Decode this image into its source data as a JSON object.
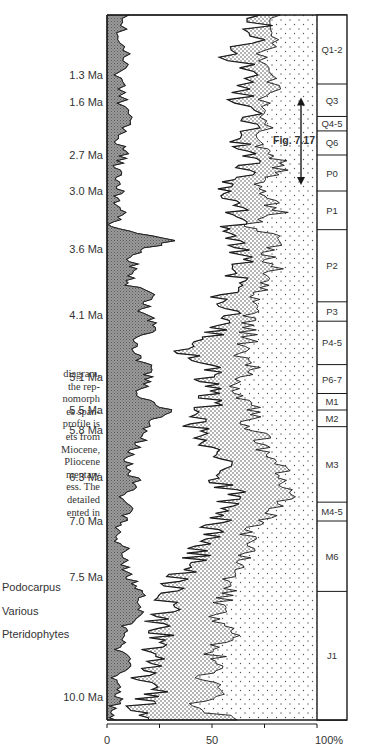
{
  "caption_fragment": [
    "diagram,",
    "the rep-",
    "nomorph",
    "es span-",
    "profile is",
    "ets from",
    "Miocene,",
    "Pliocene",
    "mentary",
    "ess. The",
    "detailed",
    "ented in"
  ],
  "legend": [
    {
      "label": "Podocarpus",
      "fill": "gray-crosshatch"
    },
    {
      "label": "Various",
      "fill": "white"
    },
    {
      "label": "Pteridophytes",
      "fill": "dense-dots"
    }
  ],
  "colors": {
    "podocarpus": "#8c8c8c",
    "line": "#1a1a1a",
    "dots": "#333333",
    "background": "#ffffff"
  },
  "chart_data": {
    "type": "area",
    "title": "",
    "xlabel": "",
    "ylabel": "Age",
    "xlim": [
      0,
      100
    ],
    "x_ticks": [
      0,
      25,
      50,
      75,
      100
    ],
    "x_tick_labels": [
      "0",
      "",
      "50",
      "",
      "100%"
    ],
    "y_direction": "age increases downward",
    "age_ticks": [
      {
        "label": "1.3 Ma",
        "age": 1.3
      },
      {
        "label": "1.6 Ma",
        "age": 1.6
      },
      {
        "label": "2.7 Ma",
        "age": 2.7
      },
      {
        "label": "3.0 Ma",
        "age": 3.0
      },
      {
        "label": "3.6 Ma",
        "age": 3.6
      },
      {
        "label": "4.1 Ma",
        "age": 4.1
      },
      {
        "label": "5.1 Ma",
        "age": 5.1
      },
      {
        "label": "5.5 Ma",
        "age": 5.5
      },
      {
        "label": "5.8 Ma",
        "age": 5.8
      },
      {
        "label": "6.3 Ma",
        "age": 6.3
      },
      {
        "label": "7.0 Ma",
        "age": 7.0
      },
      {
        "label": "7.5 Ma",
        "age": 7.5
      },
      {
        "label": "10.0 Ma",
        "age": 10.0
      }
    ],
    "zones": [
      {
        "label": "Q1-2",
        "top_age": 0.6,
        "bottom_age": 1.4
      },
      {
        "label": "Q3",
        "top_age": 1.4,
        "bottom_age": 1.9
      },
      {
        "label": "Q4-5",
        "top_age": 1.9,
        "bottom_age": 2.2
      },
      {
        "label": "Q6",
        "top_age": 2.2,
        "bottom_age": 2.7
      },
      {
        "label": "P0",
        "top_age": 2.7,
        "bottom_age": 3.0
      },
      {
        "label": "P1",
        "top_age": 3.0,
        "bottom_age": 3.4
      },
      {
        "label": "P2",
        "top_age": 3.4,
        "bottom_age": 4.0
      },
      {
        "label": "P3",
        "top_age": 4.0,
        "bottom_age": 4.2
      },
      {
        "label": "P4-5",
        "top_age": 4.2,
        "bottom_age": 4.9
      },
      {
        "label": "P6-7",
        "top_age": 4.9,
        "bottom_age": 5.3
      },
      {
        "label": "M1",
        "top_age": 5.3,
        "bottom_age": 5.5
      },
      {
        "label": "M2",
        "top_age": 5.5,
        "bottom_age": 5.75
      },
      {
        "label": "M3",
        "top_age": 5.75,
        "bottom_age": 6.7
      },
      {
        "label": "M4-5",
        "top_age": 6.7,
        "bottom_age": 7.0
      },
      {
        "label": "M6",
        "top_age": 7.0,
        "bottom_age": 7.8
      },
      {
        "label": "J1",
        "top_age": 7.8,
        "bottom_age": 10.6
      }
    ],
    "annotation": {
      "label": "Fig. 7.17",
      "from_zone": "Q3",
      "to_zone": "P0",
      "type": "double-arrow"
    },
    "series": [
      {
        "name": "Podocarpus",
        "description": "cumulative % boundary (left gray area)",
        "depth_fraction": [
          0.0,
          0.03,
          0.06,
          0.09,
          0.12,
          0.15,
          0.18,
          0.2,
          0.22,
          0.24,
          0.26,
          0.28,
          0.3,
          0.32,
          0.34,
          0.36,
          0.38,
          0.4,
          0.42,
          0.44,
          0.46,
          0.48,
          0.5,
          0.52,
          0.54,
          0.56,
          0.58,
          0.6,
          0.62,
          0.64,
          0.66,
          0.68,
          0.7,
          0.72,
          0.74,
          0.76,
          0.78,
          0.8,
          0.82,
          0.84,
          0.86,
          0.88,
          0.9,
          0.92,
          0.94,
          0.96,
          0.98,
          1.0
        ],
        "values": [
          8,
          6,
          9,
          5,
          7,
          10,
          6,
          8,
          4,
          7,
          5,
          6,
          3,
          30,
          10,
          13,
          9,
          22,
          17,
          24,
          15,
          12,
          20,
          18,
          14,
          30,
          20,
          17,
          12,
          9,
          14,
          8,
          10,
          6,
          5,
          9,
          7,
          12,
          16,
          18,
          10,
          8,
          6,
          10,
          4,
          6,
          3,
          4
        ]
      },
      {
        "name": "Various",
        "description": "cumulative % boundary (start of dotted Pteridophytes)",
        "depth_fraction": [
          0.0,
          0.03,
          0.06,
          0.09,
          0.12,
          0.15,
          0.18,
          0.2,
          0.22,
          0.24,
          0.26,
          0.28,
          0.3,
          0.32,
          0.34,
          0.36,
          0.38,
          0.4,
          0.42,
          0.44,
          0.46,
          0.48,
          0.5,
          0.52,
          0.54,
          0.56,
          0.58,
          0.6,
          0.62,
          0.64,
          0.66,
          0.68,
          0.7,
          0.72,
          0.74,
          0.76,
          0.78,
          0.8,
          0.82,
          0.84,
          0.86,
          0.88,
          0.9,
          0.92,
          0.94,
          0.96,
          0.98,
          1.0
        ],
        "values": [
          74,
          70,
          60,
          72,
          62,
          70,
          64,
          68,
          65,
          60,
          58,
          62,
          60,
          58,
          66,
          64,
          60,
          56,
          60,
          55,
          50,
          36,
          52,
          46,
          50,
          48,
          42,
          46,
          52,
          58,
          54,
          60,
          56,
          52,
          48,
          44,
          40,
          34,
          28,
          30,
          22,
          26,
          20,
          24,
          18,
          22,
          16,
          20
        ]
      },
      {
        "name": "Pteridophytes",
        "description": "cumulative % boundary (end of dense dotted area; remainder to 100% light dots)",
        "depth_fraction": [
          0.0,
          0.03,
          0.06,
          0.09,
          0.12,
          0.15,
          0.18,
          0.2,
          0.22,
          0.24,
          0.26,
          0.28,
          0.3,
          0.32,
          0.34,
          0.36,
          0.38,
          0.4,
          0.42,
          0.44,
          0.46,
          0.48,
          0.5,
          0.52,
          0.54,
          0.56,
          0.58,
          0.6,
          0.62,
          0.64,
          0.66,
          0.68,
          0.7,
          0.72,
          0.74,
          0.76,
          0.78,
          0.8,
          0.82,
          0.84,
          0.86,
          0.88,
          0.9,
          0.92,
          0.94,
          0.96,
          0.98,
          1.0
        ],
        "values": [
          78,
          80,
          72,
          82,
          74,
          76,
          72,
          80,
          84,
          72,
          76,
          82,
          68,
          84,
          76,
          80,
          74,
          72,
          70,
          66,
          68,
          62,
          70,
          64,
          60,
          70,
          68,
          74,
          76,
          82,
          84,
          86,
          82,
          72,
          66,
          70,
          62,
          60,
          58,
          54,
          52,
          60,
          48,
          56,
          44,
          58,
          40,
          62
        ]
      }
    ]
  }
}
